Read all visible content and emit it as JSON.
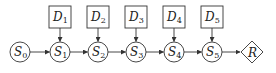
{
  "diagram": {
    "states": [
      {
        "id": "S0",
        "name": "S",
        "sub": "0",
        "cx": 20
      },
      {
        "id": "S1",
        "name": "S",
        "sub": "1",
        "cx": 60
      },
      {
        "id": "S2",
        "name": "S",
        "sub": "2",
        "cx": 98
      },
      {
        "id": "S3",
        "name": "S",
        "sub": "3",
        "cx": 136
      },
      {
        "id": "S4",
        "name": "S",
        "sub": "4",
        "cx": 174
      },
      {
        "id": "S5",
        "name": "S",
        "sub": "5",
        "cx": 212
      }
    ],
    "decisions": [
      {
        "id": "D1",
        "name": "D",
        "sub": "1",
        "target": "S1"
      },
      {
        "id": "D2",
        "name": "D",
        "sub": "2",
        "target": "S2"
      },
      {
        "id": "D3",
        "name": "D",
        "sub": "3",
        "target": "S3"
      },
      {
        "id": "D4",
        "name": "D",
        "sub": "4",
        "target": "S4"
      },
      {
        "id": "D5",
        "name": "D",
        "sub": "5",
        "target": "S5"
      }
    ],
    "reward": {
      "id": "R",
      "name": "R"
    },
    "edges": [
      [
        "S0",
        "S1"
      ],
      [
        "S1",
        "S2"
      ],
      [
        "S2",
        "S3"
      ],
      [
        "S3",
        "S4"
      ],
      [
        "S4",
        "S5"
      ],
      [
        "S5",
        "R"
      ],
      [
        "D1",
        "S1"
      ],
      [
        "D2",
        "S2"
      ],
      [
        "D3",
        "S3"
      ],
      [
        "D4",
        "S4"
      ],
      [
        "D5",
        "S5"
      ]
    ],
    "colors": {
      "stroke": "#333333",
      "fill": "#ffffff",
      "text": "#222222"
    }
  }
}
